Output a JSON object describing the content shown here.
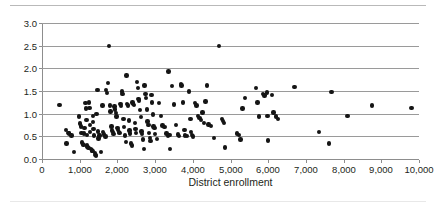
{
  "chart_data": {
    "type": "scatter",
    "title": "",
    "xlabel": "District enrollment",
    "ylabel": "",
    "xlim": [
      0,
      10000
    ],
    "ylim": [
      0,
      3.0
    ],
    "xticks": [
      0,
      1000,
      2000,
      3000,
      4000,
      5000,
      6000,
      7000,
      8000,
      9000,
      10000
    ],
    "xtick_labels": [
      "0",
      "1,000",
      "2,000",
      "3,000",
      "4,000",
      "5,000",
      "6,000",
      "7,000",
      "8,000",
      "9,000",
      "10,000"
    ],
    "yticks": [
      0.0,
      0.5,
      1.0,
      1.5,
      2.0,
      2.5,
      3.0
    ],
    "ytick_labels": [
      "0.0",
      "0.5",
      "1.0",
      "1.5",
      "2.0",
      "2.5",
      "3.0"
    ],
    "grid": "horizontal",
    "legend": "none",
    "marker": {
      "shape": "circle",
      "color": "#151515",
      "size": 4.4
    },
    "n_points": 173,
    "points": [
      [
        460,
        1.19
      ],
      [
        640,
        0.64
      ],
      [
        650,
        0.34
      ],
      [
        700,
        0.57
      ],
      [
        720,
        0.56
      ],
      [
        780,
        0.52
      ],
      [
        850,
        0.15
      ],
      [
        980,
        0.94
      ],
      [
        1010,
        0.78
      ],
      [
        1030,
        0.72
      ],
      [
        1050,
        0.58
      ],
      [
        1060,
        0.36
      ],
      [
        1080,
        0.33
      ],
      [
        1100,
        0.31
      ],
      [
        1120,
        0.56
      ],
      [
        1130,
        0.69
      ],
      [
        1150,
        1.23
      ],
      [
        1160,
        1.11
      ],
      [
        1180,
        0.86
      ],
      [
        1190,
        0.53
      ],
      [
        1200,
        0.3
      ],
      [
        1210,
        0.27
      ],
      [
        1230,
        0.24
      ],
      [
        1250,
        1.25
      ],
      [
        1260,
        1.13
      ],
      [
        1270,
        0.75
      ],
      [
        1280,
        0.6
      ],
      [
        1300,
        0.22
      ],
      [
        1320,
        0.19
      ],
      [
        1340,
        0.17
      ],
      [
        1350,
        0.95
      ],
      [
        1360,
        0.82
      ],
      [
        1370,
        0.66
      ],
      [
        1380,
        0.52
      ],
      [
        1400,
        0.13
      ],
      [
        1420,
        0.09
      ],
      [
        1430,
        0.07
      ],
      [
        1450,
        0.99
      ],
      [
        1470,
        1.52
      ],
      [
        1490,
        0.61
      ],
      [
        1500,
        0.45
      ],
      [
        1520,
        0.52
      ],
      [
        1560,
        0.15
      ],
      [
        1600,
        1.18
      ],
      [
        1620,
        0.59
      ],
      [
        1640,
        0.54
      ],
      [
        1680,
        0.5
      ],
      [
        1700,
        1.52
      ],
      [
        1720,
        1.46
      ],
      [
        1750,
        1.67
      ],
      [
        1780,
        2.49
      ],
      [
        1800,
        1.18
      ],
      [
        1820,
        1.05
      ],
      [
        1840,
        0.72
      ],
      [
        1860,
        0.63
      ],
      [
        1880,
        0.59
      ],
      [
        1900,
        0.55
      ],
      [
        1920,
        1.16
      ],
      [
        1940,
        1.09
      ],
      [
        1960,
        1.02
      ],
      [
        1980,
        0.94
      ],
      [
        2000,
        0.68
      ],
      [
        2020,
        0.64
      ],
      [
        2040,
        0.6
      ],
      [
        2060,
        0.57
      ],
      [
        2080,
        1.21
      ],
      [
        2100,
        1.17
      ],
      [
        2120,
        1.49
      ],
      [
        2140,
        1.43
      ],
      [
        2160,
        0.88
      ],
      [
        2180,
        0.7
      ],
      [
        2200,
        0.52
      ],
      [
        2220,
        0.37
      ],
      [
        2240,
        1.84
      ],
      [
        2260,
        1.21
      ],
      [
        2280,
        1.18
      ],
      [
        2300,
        0.85
      ],
      [
        2320,
        0.63
      ],
      [
        2340,
        0.56
      ],
      [
        2360,
        0.34
      ],
      [
        2380,
        0.3
      ],
      [
        2400,
        1.25
      ],
      [
        2420,
        1.22
      ],
      [
        2440,
        1.19
      ],
      [
        2460,
        0.8
      ],
      [
        2480,
        0.66
      ],
      [
        2500,
        0.58
      ],
      [
        2520,
        1.7
      ],
      [
        2540,
        1.57
      ],
      [
        2560,
        1.33
      ],
      [
        2580,
        1.29
      ],
      [
        2600,
        1.08
      ],
      [
        2620,
        0.92
      ],
      [
        2640,
        0.61
      ],
      [
        2660,
        0.55
      ],
      [
        2680,
        0.43
      ],
      [
        2700,
        0.22
      ],
      [
        2720,
        1.62
      ],
      [
        2740,
        1.44
      ],
      [
        2760,
        1.35
      ],
      [
        2780,
        1.09
      ],
      [
        2800,
        0.83
      ],
      [
        2820,
        0.75
      ],
      [
        2840,
        0.58
      ],
      [
        2860,
        0.47
      ],
      [
        2880,
        0.4
      ],
      [
        2900,
        1.41
      ],
      [
        2920,
        1.25
      ],
      [
        2940,
        0.98
      ],
      [
        2960,
        0.72
      ],
      [
        2980,
        0.68
      ],
      [
        3000,
        0.55
      ],
      [
        3050,
        0.44
      ],
      [
        3100,
        1.23
      ],
      [
        3150,
        0.95
      ],
      [
        3200,
        0.74
      ],
      [
        3250,
        0.7
      ],
      [
        3300,
        0.56
      ],
      [
        3340,
        0.51
      ],
      [
        3360,
        1.93
      ],
      [
        3380,
        0.53
      ],
      [
        3400,
        0.22
      ],
      [
        3450,
        1.61
      ],
      [
        3500,
        1.2
      ],
      [
        3550,
        0.75
      ],
      [
        3600,
        0.54
      ],
      [
        3640,
        0.51
      ],
      [
        3680,
        1.66
      ],
      [
        3700,
        1.62
      ],
      [
        3740,
        1.25
      ],
      [
        3780,
        0.64
      ],
      [
        3800,
        0.52
      ],
      [
        3840,
        0.51
      ],
      [
        3900,
        1.49
      ],
      [
        3940,
        0.88
      ],
      [
        3960,
        0.6
      ],
      [
        3980,
        0.53
      ],
      [
        4000,
        0.5
      ],
      [
        4060,
        1.24
      ],
      [
        4100,
        1.18
      ],
      [
        4140,
        0.95
      ],
      [
        4180,
        0.9
      ],
      [
        4220,
        0.86
      ],
      [
        4260,
        1.03
      ],
      [
        4300,
        0.79
      ],
      [
        4340,
        1.27
      ],
      [
        4380,
        1.62
      ],
      [
        4420,
        0.76
      ],
      [
        4480,
        0.73
      ],
      [
        4560,
        0.47
      ],
      [
        4700,
        2.49
      ],
      [
        4780,
        0.88
      ],
      [
        4800,
        0.84
      ],
      [
        4820,
        0.8
      ],
      [
        4860,
        0.25
      ],
      [
        5180,
        0.56
      ],
      [
        5220,
        0.53
      ],
      [
        5260,
        0.43
      ],
      [
        5320,
        1.11
      ],
      [
        5380,
        1.34
      ],
      [
        5680,
        1.56
      ],
      [
        5720,
        1.25
      ],
      [
        5760,
        0.94
      ],
      [
        5860,
        1.44
      ],
      [
        5900,
        1.4
      ],
      [
        5960,
        1.47
      ],
      [
        5980,
        0.95
      ],
      [
        6000,
        0.41
      ],
      [
        6100,
        1.41
      ],
      [
        6140,
        1.03
      ],
      [
        6200,
        0.94
      ],
      [
        6260,
        0.88
      ],
      [
        6700,
        1.59
      ],
      [
        7340,
        0.6
      ],
      [
        7620,
        0.34
      ],
      [
        7680,
        1.48
      ],
      [
        8100,
        0.95
      ],
      [
        8760,
        1.18
      ],
      [
        9800,
        1.12
      ]
    ]
  }
}
